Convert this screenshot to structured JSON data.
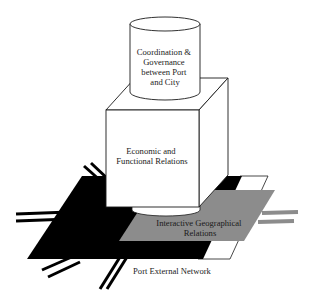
{
  "diagram": {
    "type": "layered-3d-concept-diagram",
    "layers": [
      {
        "id": "coordination",
        "shape": "cylinder",
        "lines": [
          "Coordination &",
          "Governance",
          "between Port",
          "and City"
        ]
      },
      {
        "id": "economic",
        "shape": "cube",
        "lines": [
          "Economic and",
          "Functional Relations"
        ]
      },
      {
        "id": "geographical",
        "shape": "gray-plane",
        "lines": [
          "Interactive Geographical",
          "Relations"
        ]
      },
      {
        "id": "network",
        "shape": "black-and-white-plane-with-roads",
        "lines": [
          "Port External Network"
        ]
      }
    ],
    "colors": {
      "background": "#ffffff",
      "outline": "#1a1a1a",
      "black_plane": "#000000",
      "gray_plane": "#8c8c8c",
      "white_fill": "#ffffff",
      "road_gray": "#8c8c8c"
    }
  }
}
